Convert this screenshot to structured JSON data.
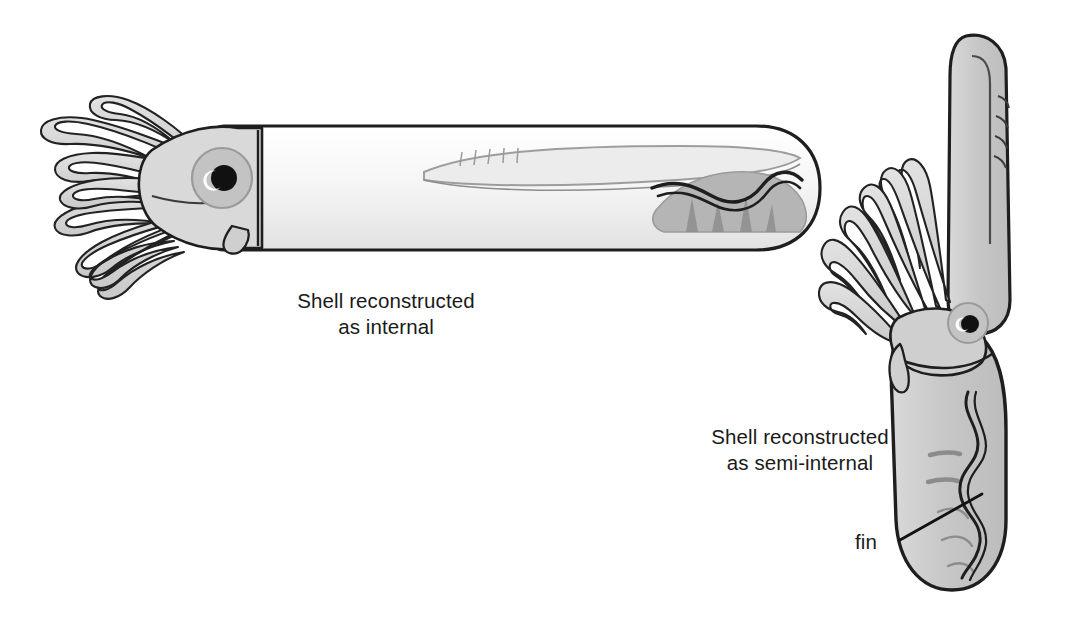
{
  "figure": {
    "background_color": "#ffffff",
    "medium": "grayscale line drawing"
  },
  "palette": {
    "ink": "#1a1a1a",
    "outline": "#222222",
    "mantle_light": "#f4f4f4",
    "mantle_grey": "#c9c9c9",
    "arm_fill": "#d5d5d5",
    "shell_fill": "#e8e8e8",
    "shade_grey": "#a9a9a9",
    "eye_iris": "#c3c3c3",
    "pupil": "#111111",
    "text": "#1a1a1a"
  },
  "labels": {
    "internal": "Shell reconstructed\nas internal",
    "semi_internal": "Shell reconstructed\nas semi-internal",
    "fin": "fin"
  },
  "specimens": [
    {
      "id": "horizontal-squid",
      "orientation": "horizontal",
      "caption": "Shell reconstructed as internal",
      "parts": [
        "arms",
        "head",
        "eye",
        "funnel",
        "mantle",
        "gladius",
        "fin"
      ]
    },
    {
      "id": "vertical-squid",
      "orientation": "vertical",
      "caption": "Shell reconstructed as semi-internal",
      "parts": [
        "arms",
        "head",
        "eye",
        "funnel",
        "mantle",
        "shell",
        "fin"
      ],
      "callout": "fin"
    }
  ]
}
